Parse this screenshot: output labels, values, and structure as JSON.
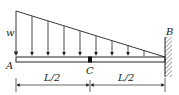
{
  "diagram": {
    "type": "cantilever-beam-triangular-load",
    "load_label": "w",
    "point_A": "A",
    "point_B": "B",
    "point_C": "C",
    "dim_left": "L/2",
    "dim_right": "L/2",
    "colors": {
      "line": "#222222",
      "beam_fill": "#ffffff",
      "hatch": "#555555"
    }
  }
}
